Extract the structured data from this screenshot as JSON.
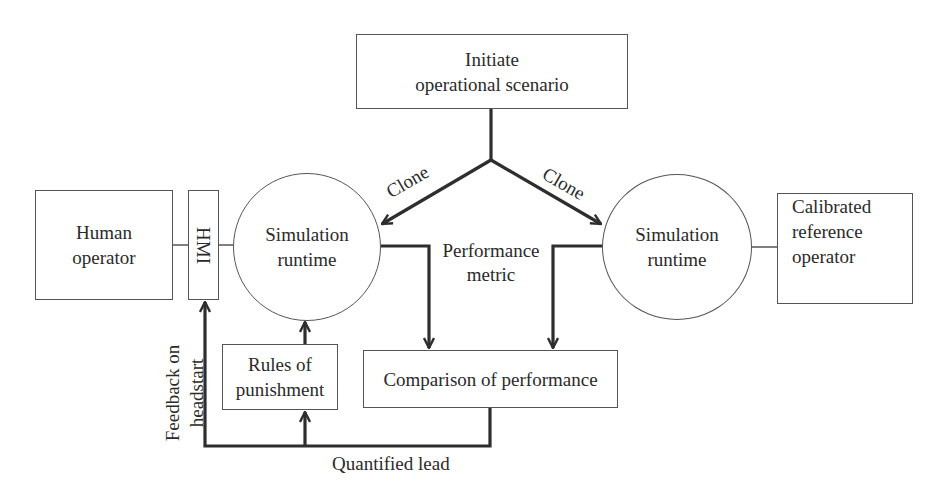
{
  "nodes": {
    "initiate": {
      "line1": "Initiate",
      "line2": "operational scenario"
    },
    "human_operator": {
      "line1": "Human",
      "line2": "operator"
    },
    "hmi": {
      "label": "HMI"
    },
    "sim_left": {
      "line1": "Simulation",
      "line2": "runtime"
    },
    "sim_right": {
      "line1": "Simulation",
      "line2": "runtime"
    },
    "calibrated": {
      "line1": "Calibrated",
      "line2": "reference",
      "line3": "operator"
    },
    "rules": {
      "line1": "Rules of",
      "line2": "punishment"
    },
    "comparison": {
      "label": "Comparison of performance"
    }
  },
  "edge_labels": {
    "clone_left": "Clone",
    "clone_right": "Clone",
    "performance_metric_line1": "Performance",
    "performance_metric_line2": "metric",
    "feedback_line1": "Feedback on",
    "feedback_line2": "headstart",
    "quantified_lead": "Quantified lead"
  },
  "colors": {
    "line": "#2e2e2e",
    "box_border": "#555555",
    "background": "#ffffff"
  }
}
